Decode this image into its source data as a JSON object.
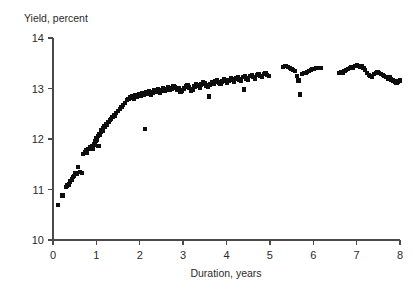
{
  "chart_data": {
    "type": "scatter",
    "title": "",
    "xlabel": "Duration, years",
    "ylabel": "Yield, percent",
    "xlim": [
      0,
      8
    ],
    "ylim": [
      10,
      14
    ],
    "xticks": [
      0,
      1,
      2,
      3,
      4,
      5,
      6,
      7,
      8
    ],
    "xtick_labels": [
      "0",
      "1",
      "2",
      "3",
      "4",
      "5",
      "6",
      "7",
      "8"
    ],
    "yticks": [
      10,
      11,
      12,
      13,
      14
    ],
    "ytick_labels": [
      "10",
      "11",
      "12",
      "13",
      "14"
    ],
    "grid": false,
    "legend": false,
    "marker_color": "#0d0d0d",
    "marker_shape": "square",
    "axis_color": "#4a4a4a",
    "points": [
      [
        0.12,
        10.7
      ],
      [
        0.22,
        10.88
      ],
      [
        0.3,
        11.05
      ],
      [
        0.33,
        11.08
      ],
      [
        0.36,
        11.1
      ],
      [
        0.4,
        11.16
      ],
      [
        0.43,
        11.2
      ],
      [
        0.46,
        11.24
      ],
      [
        0.49,
        11.27
      ],
      [
        0.52,
        11.32
      ],
      [
        0.55,
        11.3
      ],
      [
        0.58,
        11.44
      ],
      [
        0.62,
        11.35
      ],
      [
        0.66,
        11.33
      ],
      [
        0.7,
        11.7
      ],
      [
        0.73,
        11.74
      ],
      [
        0.76,
        11.78
      ],
      [
        0.79,
        11.72
      ],
      [
        0.82,
        11.8
      ],
      [
        0.85,
        11.84
      ],
      [
        0.88,
        11.82
      ],
      [
        0.9,
        11.86
      ],
      [
        0.92,
        11.8
      ],
      [
        0.94,
        11.9
      ],
      [
        0.96,
        11.88
      ],
      [
        0.98,
        11.96
      ],
      [
        1.0,
        12.02
      ],
      [
        1.02,
        11.98
      ],
      [
        1.04,
        12.06
      ],
      [
        1.06,
        12.1
      ],
      [
        1.08,
        12.08
      ],
      [
        1.1,
        12.14
      ],
      [
        1.12,
        12.18
      ],
      [
        1.05,
        11.86
      ],
      [
        1.14,
        12.16
      ],
      [
        1.16,
        12.22
      ],
      [
        1.18,
        12.26
      ],
      [
        1.2,
        12.24
      ],
      [
        1.22,
        12.3
      ],
      [
        1.25,
        12.28
      ],
      [
        1.28,
        12.34
      ],
      [
        1.31,
        12.38
      ],
      [
        1.34,
        12.4
      ],
      [
        1.37,
        12.44
      ],
      [
        1.4,
        12.48
      ],
      [
        1.43,
        12.46
      ],
      [
        1.46,
        12.52
      ],
      [
        1.5,
        12.56
      ],
      [
        1.54,
        12.6
      ],
      [
        1.58,
        12.64
      ],
      [
        1.62,
        12.68
      ],
      [
        1.66,
        12.72
      ],
      [
        1.7,
        12.78
      ],
      [
        1.74,
        12.8
      ],
      [
        1.78,
        12.82
      ],
      [
        1.82,
        12.84
      ],
      [
        1.86,
        12.8
      ],
      [
        1.9,
        12.86
      ],
      [
        1.94,
        12.84
      ],
      [
        1.98,
        12.88
      ],
      [
        2.02,
        12.86
      ],
      [
        2.06,
        12.9
      ],
      [
        2.1,
        12.88
      ],
      [
        2.12,
        12.2
      ],
      [
        2.14,
        12.92
      ],
      [
        2.18,
        12.9
      ],
      [
        2.22,
        12.94
      ],
      [
        2.26,
        12.88
      ],
      [
        2.3,
        12.92
      ],
      [
        2.34,
        12.96
      ],
      [
        2.38,
        12.94
      ],
      [
        2.42,
        12.98
      ],
      [
        2.46,
        12.92
      ],
      [
        2.5,
        12.96
      ],
      [
        2.54,
        13.0
      ],
      [
        2.58,
        12.96
      ],
      [
        2.62,
        12.98
      ],
      [
        2.66,
        13.02
      ],
      [
        2.7,
        12.98
      ],
      [
        2.74,
        13.0
      ],
      [
        2.78,
        13.04
      ],
      [
        2.82,
        13.02
      ],
      [
        2.86,
        12.98
      ],
      [
        2.9,
        13.0
      ],
      [
        2.94,
        12.94
      ],
      [
        2.98,
        12.96
      ],
      [
        3.02,
        13.0
      ],
      [
        3.06,
        13.04
      ],
      [
        3.1,
        13.06
      ],
      [
        3.14,
        13.02
      ],
      [
        3.18,
        12.96
      ],
      [
        3.22,
        12.98
      ],
      [
        3.26,
        13.04
      ],
      [
        3.3,
        13.08
      ],
      [
        3.34,
        13.06
      ],
      [
        3.38,
        13.02
      ],
      [
        3.42,
        13.08
      ],
      [
        3.46,
        13.12
      ],
      [
        3.5,
        13.1
      ],
      [
        3.54,
        13.06
      ],
      [
        3.58,
        13.04
      ],
      [
        3.62,
        13.08
      ],
      [
        3.66,
        13.12
      ],
      [
        3.7,
        13.1
      ],
      [
        3.74,
        13.14
      ],
      [
        3.78,
        13.16
      ],
      [
        3.82,
        13.12
      ],
      [
        3.86,
        13.1
      ],
      [
        3.9,
        13.14
      ],
      [
        3.94,
        13.18
      ],
      [
        3.98,
        13.16
      ],
      [
        3.6,
        12.84
      ],
      [
        4.02,
        13.12
      ],
      [
        4.06,
        13.16
      ],
      [
        4.1,
        13.2
      ],
      [
        4.14,
        13.18
      ],
      [
        4.18,
        13.14
      ],
      [
        4.22,
        13.2
      ],
      [
        4.26,
        13.22
      ],
      [
        4.3,
        13.18
      ],
      [
        4.34,
        13.16
      ],
      [
        4.38,
        13.22
      ],
      [
        4.42,
        13.24
      ],
      [
        4.46,
        13.2
      ],
      [
        4.5,
        13.18
      ],
      [
        4.54,
        13.24
      ],
      [
        4.58,
        13.26
      ],
      [
        4.62,
        13.22
      ],
      [
        4.66,
        13.2
      ],
      [
        4.7,
        13.26
      ],
      [
        4.74,
        13.28
      ],
      [
        4.78,
        13.24
      ],
      [
        4.82,
        13.22
      ],
      [
        4.86,
        13.28
      ],
      [
        4.9,
        13.3
      ],
      [
        4.94,
        13.26
      ],
      [
        4.98,
        13.24
      ],
      [
        4.4,
        12.98
      ],
      [
        5.3,
        13.42
      ],
      [
        5.34,
        13.44
      ],
      [
        5.38,
        13.44
      ],
      [
        5.42,
        13.42
      ],
      [
        5.46,
        13.4
      ],
      [
        5.5,
        13.38
      ],
      [
        5.54,
        13.36
      ],
      [
        5.58,
        13.34
      ],
      [
        5.62,
        13.24
      ],
      [
        5.66,
        13.16
      ],
      [
        5.7,
        12.88
      ],
      [
        5.74,
        13.28
      ],
      [
        5.78,
        13.3
      ],
      [
        5.82,
        13.3
      ],
      [
        5.86,
        13.32
      ],
      [
        5.9,
        13.34
      ],
      [
        5.94,
        13.36
      ],
      [
        5.98,
        13.38
      ],
      [
        6.02,
        13.38
      ],
      [
        6.06,
        13.4
      ],
      [
        6.1,
        13.4
      ],
      [
        6.14,
        13.4
      ],
      [
        6.18,
        13.4
      ],
      [
        6.6,
        13.3
      ],
      [
        6.64,
        13.32
      ],
      [
        6.68,
        13.3
      ],
      [
        6.72,
        13.34
      ],
      [
        6.76,
        13.36
      ],
      [
        6.8,
        13.38
      ],
      [
        6.84,
        13.4
      ],
      [
        6.88,
        13.42
      ],
      [
        6.92,
        13.4
      ],
      [
        6.96,
        13.44
      ],
      [
        7.0,
        13.46
      ],
      [
        7.04,
        13.44
      ],
      [
        7.08,
        13.42
      ],
      [
        7.12,
        13.44
      ],
      [
        7.16,
        13.4
      ],
      [
        7.2,
        13.36
      ],
      [
        7.24,
        13.3
      ],
      [
        7.28,
        13.26
      ],
      [
        7.32,
        13.24
      ],
      [
        7.36,
        13.22
      ],
      [
        7.4,
        13.28
      ],
      [
        7.44,
        13.3
      ],
      [
        7.48,
        13.32
      ],
      [
        7.52,
        13.3
      ],
      [
        7.56,
        13.28
      ],
      [
        7.6,
        13.26
      ],
      [
        7.64,
        13.24
      ],
      [
        7.68,
        13.22
      ],
      [
        7.72,
        13.2
      ],
      [
        7.76,
        13.22
      ],
      [
        7.8,
        13.18
      ],
      [
        7.84,
        13.16
      ],
      [
        7.88,
        13.14
      ],
      [
        7.92,
        13.12
      ],
      [
        7.96,
        13.14
      ],
      [
        8.0,
        13.16
      ]
    ]
  }
}
